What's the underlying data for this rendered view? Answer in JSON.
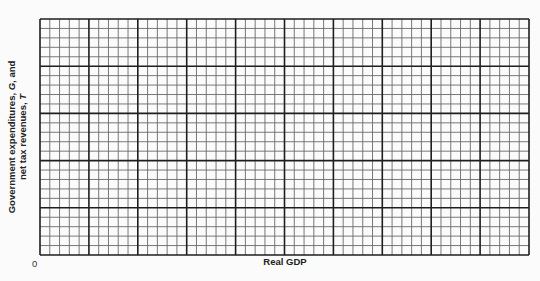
{
  "chart_data": {
    "type": "line",
    "title": "",
    "xlabel": "Real GDP",
    "ylabel": "Government expenditures, G, and net tax revenues, T",
    "ylabel_lines": [
      "Government expenditures, ",
      "G",
      ", and",
      "net tax revenues, ",
      "T"
    ],
    "origin_label": "0",
    "series": [],
    "grid": {
      "on": true,
      "major_columns": 10,
      "major_rows": 5,
      "minor_per_major": 5,
      "minor_color": "#6a6a6a",
      "major_color": "#1e1e1e",
      "background": "#fbfbfb"
    },
    "xlim": [
      0,
      50
    ],
    "ylim": [
      0,
      25
    ],
    "legend": null
  }
}
